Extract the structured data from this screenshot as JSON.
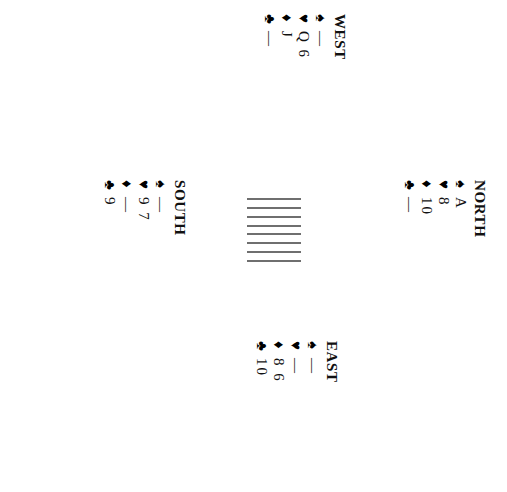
{
  "diagram": {
    "type": "bridge-hand-diagram",
    "orientation": "rotated-90-clockwise",
    "background_color": "#ffffff",
    "ink_color": "#000000",
    "hatch_color": "#6f6f6f"
  },
  "suits": {
    "spade": {
      "name": "spade-pip",
      "glyph": "♠"
    },
    "heart": {
      "name": "heart-pip",
      "glyph": "♥"
    },
    "diamond": {
      "name": "diamond-pip",
      "glyph": "♦"
    },
    "club": {
      "name": "club-pip",
      "glyph": "♣"
    }
  },
  "void_symbol": "—",
  "hands": {
    "west": {
      "label": "WEST",
      "spades": "—",
      "hearts": "Q 6",
      "diamonds": "J",
      "clubs": "—"
    },
    "north": {
      "label": "NORTH",
      "spades": "A",
      "hearts": "8",
      "diamonds": "10",
      "clubs": "—"
    },
    "south": {
      "label": "SOUTH",
      "spades": "—",
      "hearts": "9 7",
      "diamonds": "—",
      "clubs": "9"
    },
    "east": {
      "label": "EAST",
      "spades": "—",
      "hearts": "—",
      "diamonds": "8 6",
      "clubs": "10"
    }
  },
  "center": {
    "name": "hatched-center-block",
    "line_count": 8
  }
}
